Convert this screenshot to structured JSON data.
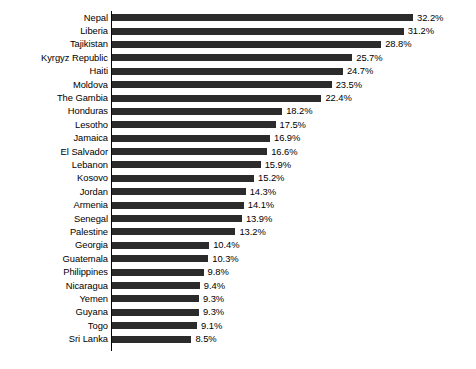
{
  "chart_data": {
    "type": "bar",
    "orientation": "horizontal",
    "title": "",
    "subtitle": "",
    "xlabel": "",
    "ylabel": "",
    "xlim": [
      0,
      32.2
    ],
    "grid": false,
    "legend": false,
    "value_suffix": "%",
    "bar_color": "#2b2b2b",
    "axis_color": "#000000",
    "background_color": "#ffffff",
    "categories": [
      "Nepal",
      "Liberia",
      "Tajikistan",
      "Kyrgyz Republic",
      "Haiti",
      "Moldova",
      "The Gambia",
      "Honduras",
      "Lesotho",
      "Jamaica",
      "El Salvador",
      "Lebanon",
      "Kosovo",
      "Jordan",
      "Armenia",
      "Senegal",
      "Palestine",
      "Georgia",
      "Guatemala",
      "Philippines",
      "Nicaragua",
      "Yemen",
      "Guyana",
      "Togo",
      "Sri Lanka"
    ],
    "values": [
      32.2,
      31.2,
      28.8,
      25.7,
      24.7,
      23.5,
      22.4,
      18.2,
      17.5,
      16.9,
      16.6,
      15.9,
      15.2,
      14.3,
      14.1,
      13.9,
      13.2,
      10.4,
      10.3,
      9.8,
      9.4,
      9.3,
      9.3,
      9.1,
      8.5
    ],
    "value_labels": [
      "32.2%",
      "31.2%",
      "28.8%",
      "25.7%",
      "24.7%",
      "23.5%",
      "22.4%",
      "18.2%",
      "17.5%",
      "16.9%",
      "16.6%",
      "15.9%",
      "15.2%",
      "14.3%",
      "14.1%",
      "13.9%",
      "13.2%",
      "10.4%",
      "10.3%",
      "9.8%",
      "9.4%",
      "9.3%",
      "9.3%",
      "9.1%",
      "8.5%"
    ]
  }
}
